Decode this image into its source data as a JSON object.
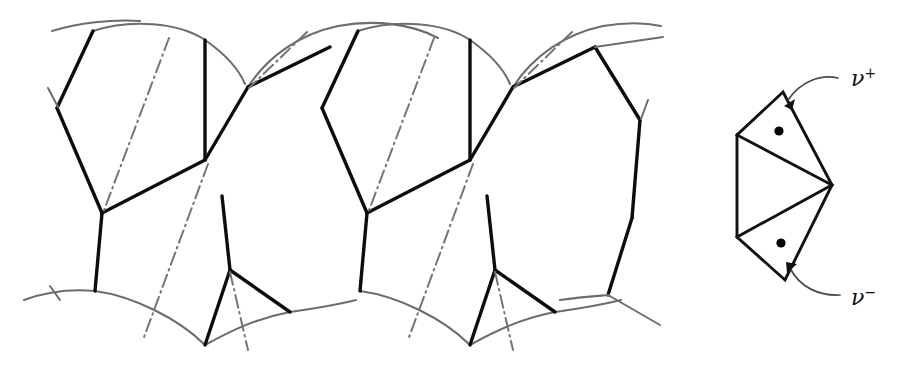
{
  "figure": {
    "background_color": "#ffffff",
    "width": 922,
    "height": 369
  },
  "colors": {
    "arc_stroke": "#6d6d6d",
    "solid_stroke": "#0d0d0d",
    "dashdot_stroke": "#757575",
    "cell_stroke": "#111111",
    "dot_fill": "#000000",
    "arrow_stroke": "#4a4a4a",
    "label_color": "#111111"
  },
  "left_panel": {
    "name": "tiling-pattern",
    "description": "Repeating tiling of circular arcs, thick polygonal edges and dash-dot bisectors",
    "period_px": 265,
    "repeats": 2
  },
  "right_panel": {
    "name": "cell-diagram",
    "description": "Hexagonal cell subdivided by two diagonals into triangles, with two marked interior points",
    "vertices": [
      {
        "name": "top-apex",
        "x": 783,
        "y": 92
      },
      {
        "name": "right-apex",
        "x": 832,
        "y": 185
      },
      {
        "name": "bottom-apex",
        "x": 785,
        "y": 280
      },
      {
        "name": "lower-left",
        "x": 737,
        "y": 237
      },
      {
        "name": "upper-left",
        "x": 737,
        "y": 135
      }
    ],
    "points": [
      {
        "name": "nu-plus-dot",
        "x": 779,
        "y": 131,
        "label": "ν",
        "superscript": "+"
      },
      {
        "name": "nu-minus-dot",
        "x": 781,
        "y": 243,
        "label": "ν",
        "superscript": "−"
      }
    ],
    "labels": {
      "nu_plus_symbol": "ν",
      "nu_plus_sup": "+",
      "nu_plus_full": "ν⁺",
      "nu_minus_symbol": "ν",
      "nu_minus_sup": "−",
      "nu_minus_full": "ν⁻"
    }
  }
}
